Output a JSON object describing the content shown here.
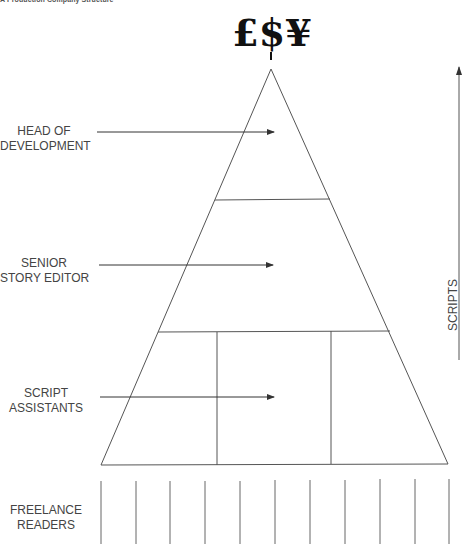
{
  "caption": "A Production Company Structure",
  "currency_symbols": "£$¥",
  "levels": [
    {
      "name": "head-of-development",
      "line1": "HEAD OF",
      "line2": "DEVELOPMENT"
    },
    {
      "name": "senior-story-editor",
      "line1": "SENIOR",
      "line2": "STORY EDITOR"
    },
    {
      "name": "script-assistants",
      "line1": "SCRIPT",
      "line2": "ASSISTANTS"
    },
    {
      "name": "freelance-readers",
      "line1": "FREELANCE",
      "line2": "READERS"
    }
  ],
  "scripts_axis": {
    "label": "SCRIPTS",
    "direction": "up"
  },
  "pyramid": {
    "tiers": 3,
    "bottom_tier_columns": 3,
    "freelance_reader_lines": 11
  },
  "colors": {
    "line": "#555555",
    "text": "#444444",
    "symbols": "#111111"
  }
}
